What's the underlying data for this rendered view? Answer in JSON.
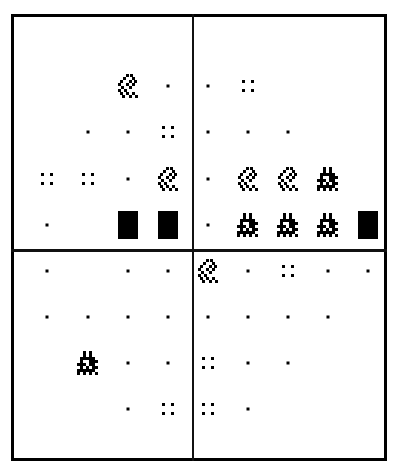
{
  "diagram": {
    "legend_codes": {
      "dot": "single small dot",
      "quad": "four-dot square",
      "sparse": "sparse hatched diamond",
      "dense": "dense dark blob",
      "block": "solid black rectangle",
      "empty": "blank"
    },
    "columns_x": [
      47,
      88,
      128,
      168,
      208,
      248,
      288,
      328,
      368
    ],
    "rows_y": [
      86,
      132,
      179,
      225,
      271,
      317,
      363,
      409
    ],
    "grid": [
      [
        "empty",
        "empty",
        "sparse",
        "dot",
        "dot",
        "quad",
        "empty",
        "empty",
        "empty"
      ],
      [
        "empty",
        "dot",
        "dot",
        "quad",
        "dot",
        "dot",
        "dot",
        "empty",
        "empty"
      ],
      [
        "quad",
        "quad",
        "dot",
        "sparse",
        "dot",
        "sparse",
        "sparse",
        "dense",
        "empty"
      ],
      [
        "dot",
        "empty",
        "block",
        "block",
        "dot",
        "dense",
        "dense",
        "dense",
        "block"
      ],
      [
        "dot",
        "empty",
        "dot",
        "dot",
        "sparse",
        "dot",
        "quad",
        "dot",
        "dot"
      ],
      [
        "dot",
        "dot",
        "dot",
        "dot",
        "dot",
        "dot",
        "dot",
        "dot",
        "empty"
      ],
      [
        "empty",
        "dense",
        "dot",
        "dot",
        "quad",
        "dot",
        "dot",
        "empty",
        "empty"
      ],
      [
        "empty",
        "empty",
        "dot",
        "quad",
        "quad",
        "dot",
        "empty",
        "empty",
        "empty"
      ]
    ],
    "colors": {
      "ink": "#000000",
      "background": "#ffffff"
    }
  }
}
